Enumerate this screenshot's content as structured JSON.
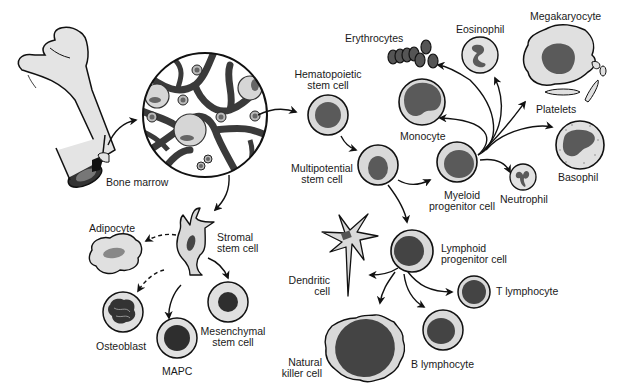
{
  "diagram": {
    "colors": {
      "outline": "#111111",
      "cytoplasm": "#d9d9d9",
      "nucleus": "#555555",
      "dark_nucleus": "#2e2e2e",
      "marrow_stroma": "#3a3a3a",
      "bone": "#e4e4e4"
    },
    "labels": {
      "bone_marrow": "Bone marrow",
      "hematopoietic": [
        "Hematopoietic",
        "stem cell"
      ],
      "multipotential": [
        "Multipotential",
        "stem cell"
      ],
      "erythrocytes": "Erythrocytes",
      "eosinophil": "Eosinophil",
      "megakaryocyte": "Megakaryocyte",
      "platelets": "Platelets",
      "monocyte": "Monocyte",
      "basophil": "Basophil",
      "myeloid": [
        "Myeloid",
        "progenitor cell"
      ],
      "neutrophil": "Neutrophil",
      "lymphoid": [
        "Lymphoid",
        "progenitor cell"
      ],
      "dendritic": [
        "Dendritic",
        "cell"
      ],
      "t_lymphocyte": "T lymphocyte",
      "natural_killer": [
        "Natural",
        "killer cell"
      ],
      "b_lymphocyte": "B lymphocyte",
      "adipocyte": "Adipocyte",
      "stromal": [
        "Stromal",
        "stem cell"
      ],
      "osteoblast": "Osteoblast",
      "mesenchymal": [
        "Mesenchymal",
        "stem cell"
      ],
      "mapc": "MAPC"
    }
  }
}
